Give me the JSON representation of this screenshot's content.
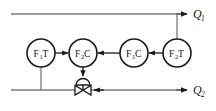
{
  "diagram": {
    "colors": {
      "line": "#7a7a7a",
      "signal": "#1a1a1a",
      "bubble_stroke": "#1a1a1a",
      "bubble_fill": "#ffffff",
      "text": "#111111",
      "background": "#ffffff"
    },
    "streams": [
      {
        "id": "q1",
        "label_main": "Q",
        "label_sub": "1",
        "position": "top-right",
        "direction": "right"
      },
      {
        "id": "q2",
        "label_main": "Q",
        "label_sub": "2",
        "position": "bottom-right",
        "direction": "right"
      }
    ],
    "bubbles": [
      {
        "id": "f1t",
        "label_main": "F",
        "label_sub": "1",
        "label_tail": "T",
        "cx": 41,
        "cy": 53,
        "r": 14
      },
      {
        "id": "f2c",
        "label_main": "F",
        "label_sub": "2",
        "label_tail": "C",
        "cx": 83,
        "cy": 53,
        "r": 14
      },
      {
        "id": "f1c",
        "label_main": "F",
        "label_sub": "1",
        "label_tail": "C",
        "cx": 134,
        "cy": 53,
        "r": 14
      },
      {
        "id": "f2t",
        "label_main": "F",
        "label_sub": "2",
        "label_tail": "T",
        "cx": 177,
        "cy": 53,
        "r": 14
      }
    ],
    "valve": {
      "id": "control-valve",
      "type": "diaphragm-control-valve",
      "cx": 83,
      "cy": 90
    },
    "signals": [
      {
        "id": "f1t-to-f2c",
        "from": "f1t",
        "to": "f2c"
      },
      {
        "id": "f1c-to-f2c",
        "from": "f1c",
        "to": "f2c"
      },
      {
        "id": "f2t-to-f1c",
        "from": "f2t",
        "to": "f1c"
      },
      {
        "id": "f2c-to-valve",
        "from": "f2c",
        "to": "control-valve"
      }
    ],
    "taps": [
      {
        "id": "f1t-tap",
        "bubble": "f1t",
        "to_stream": "q2"
      },
      {
        "id": "f2t-tap",
        "bubble": "f2t",
        "to_stream": "q1"
      }
    ]
  }
}
